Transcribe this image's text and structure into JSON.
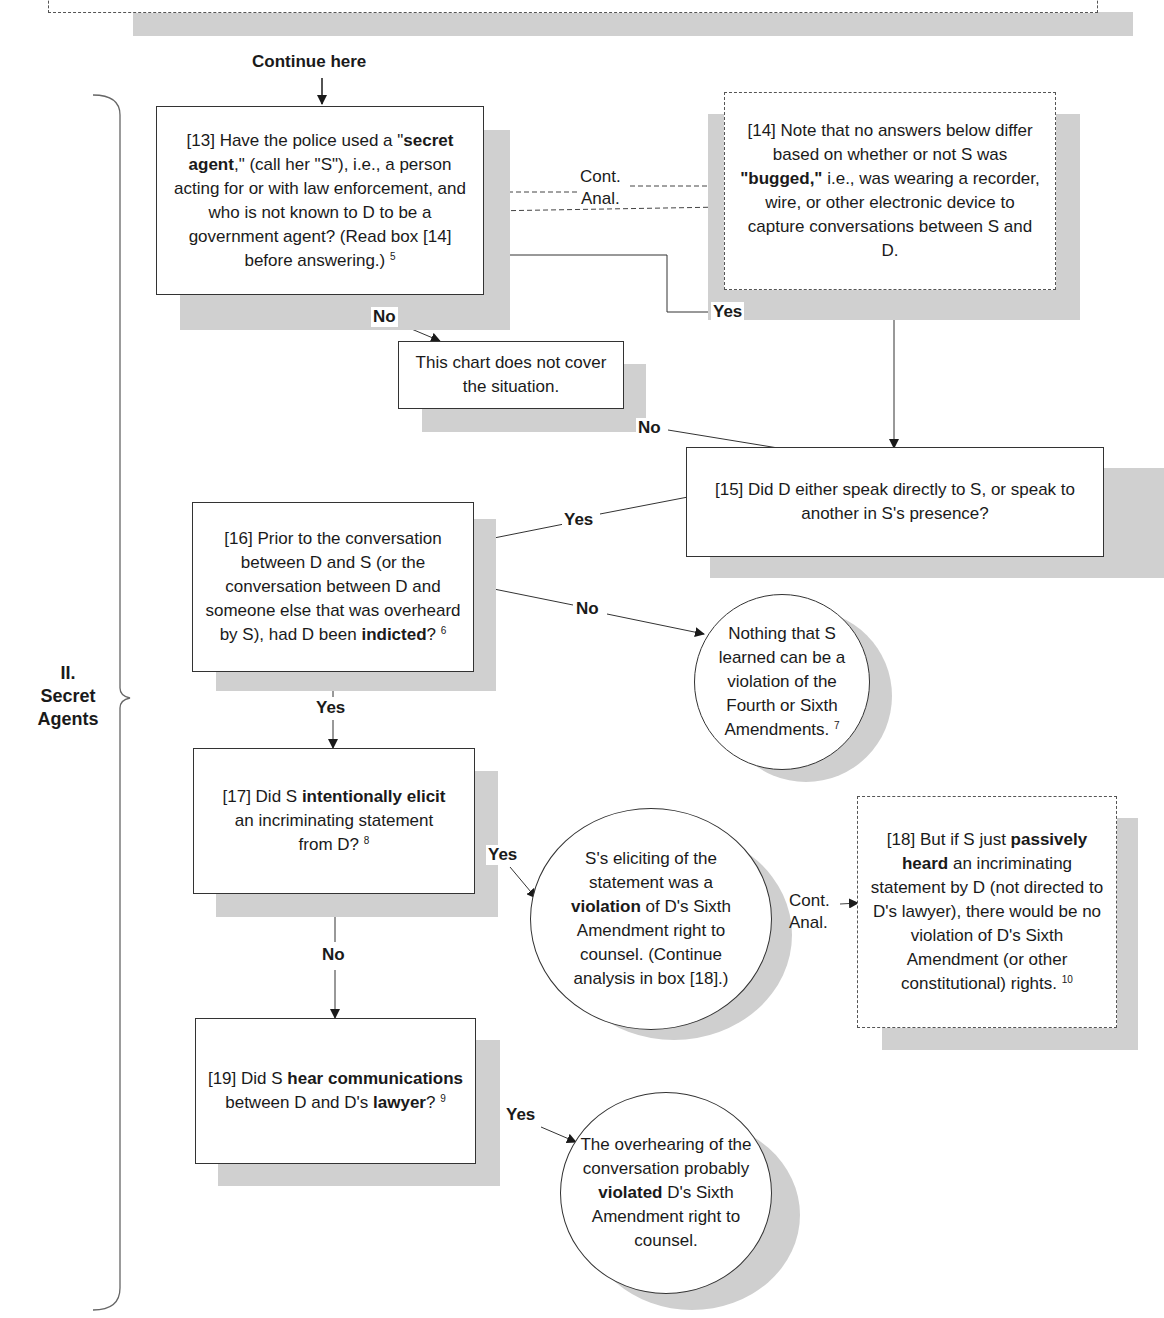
{
  "top_box": {
    "partial": true
  },
  "continue_here": "Continue here",
  "section": {
    "numeral": "II.",
    "line1": "Secret",
    "line2": "Agents"
  },
  "box13": {
    "number": "[13]",
    "pre": "Have the police used a",
    "bold": "secret agent",
    "post": "\" (call her \"S\"), i.e., a person acting for or with law enforcement, and who is not known to D to be a government agent? (Read box [14] before answering.)",
    "footnote": "5"
  },
  "box14": {
    "number": "[14]",
    "pre": "Note that no answers below differ based on whether or not S was",
    "bold": "\"bugged,\"",
    "post": "i.e., was wearing a recorder, wire, or other electronic device to capture conversations between S and D."
  },
  "cont_anal_top": {
    "line1": "Cont.",
    "line2": "Anal."
  },
  "no_cover": {
    "text": "This chart does not cover the situation."
  },
  "box15": {
    "text": "[15] Did D either speak directly to S, or speak to another in S's presence?"
  },
  "box16": {
    "pre": "[16] Prior to the conversation between D and S (or the conversation between D and someone else that was overheard by S), had D been",
    "bold": "indicted",
    "post": "?",
    "footnote": "6"
  },
  "circle_nothing": {
    "text": "Nothing that S learned can be a violation of the Fourth or Sixth Amendments.",
    "footnote": "7"
  },
  "box17": {
    "pre": "[17] Did S",
    "bold1": "intentionally elicit",
    "post": "an incriminating statement from D?",
    "footnote": "8"
  },
  "circle_elicit": {
    "pre": "S's eliciting of the statement was a",
    "bold": "violation",
    "post": "of D's Sixth Amendment right to counsel. (Continue analysis in box [18].)"
  },
  "cont_anal_mid": {
    "line1": "Cont.",
    "line2": "Anal."
  },
  "box18": {
    "pre": "[18] But if S just",
    "bold": "passively heard",
    "post": "an incriminating statement by D (not directed to D's lawyer), there would be no violation of D's Sixth Amendment (or other constitutional) rights.",
    "footnote": "10"
  },
  "box19": {
    "pre": "[19] Did S",
    "bold1": "hear communications",
    "mid": "between D and D's",
    "bold2": "lawyer",
    "post": "?",
    "footnote": "9"
  },
  "circle_overhear": {
    "pre": "The overhearing of the conversation probably",
    "bold": "violated",
    "post": "D's Sixth Amendment right to counsel."
  },
  "edge_labels": {
    "no_13": "No",
    "yes_13": "Yes",
    "no_15": "No",
    "yes_15": "Yes",
    "no_16": "No",
    "yes_16": "Yes",
    "yes_17": "Yes",
    "no_17": "No",
    "yes_19": "Yes"
  },
  "colors": {
    "shadow": "#d0d0d0",
    "line": "#333333",
    "background": "#ffffff"
  }
}
